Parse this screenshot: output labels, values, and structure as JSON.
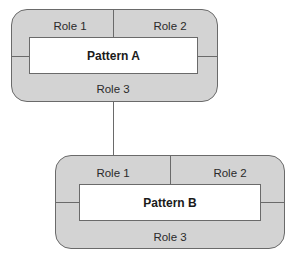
{
  "patterns": [
    {
      "name": "Pattern A",
      "roles": [
        "Role 1",
        "Role 2",
        "Role 3"
      ]
    },
    {
      "name": "Pattern B",
      "roles": [
        "Role 1",
        "Role 2",
        "Role 3"
      ]
    }
  ],
  "colors": {
    "fill": "#d3d3d3",
    "stroke": "#6a6a6a",
    "inner": "#ffffff"
  }
}
